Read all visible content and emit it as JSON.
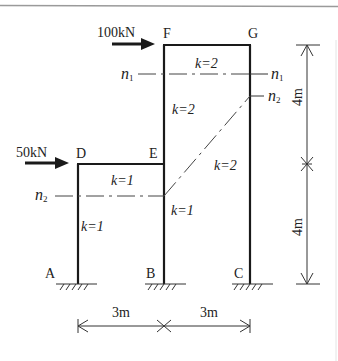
{
  "diagram": {
    "type": "structural-frame",
    "nodes": {
      "A": "A",
      "B": "B",
      "C": "C",
      "D": "D",
      "E": "E",
      "F": "F",
      "G": "G"
    },
    "loads": [
      {
        "label": "100kN",
        "at": "F"
      },
      {
        "label": "50kN",
        "at": "D"
      }
    ],
    "stiffness": {
      "FG": "k=2",
      "BF_upper": "k=2",
      "CG": "k=2",
      "DE": "k=1",
      "AD": "k=1",
      "BE": "k=1"
    },
    "sections": {
      "n1_left": "n1",
      "n1_right": "n1",
      "n2_left": "n2",
      "n2_right": "n2"
    },
    "dimensions": {
      "span_AB": "3m",
      "span_BC": "3m",
      "height_upper": "4m",
      "height_lower": "4m"
    }
  }
}
